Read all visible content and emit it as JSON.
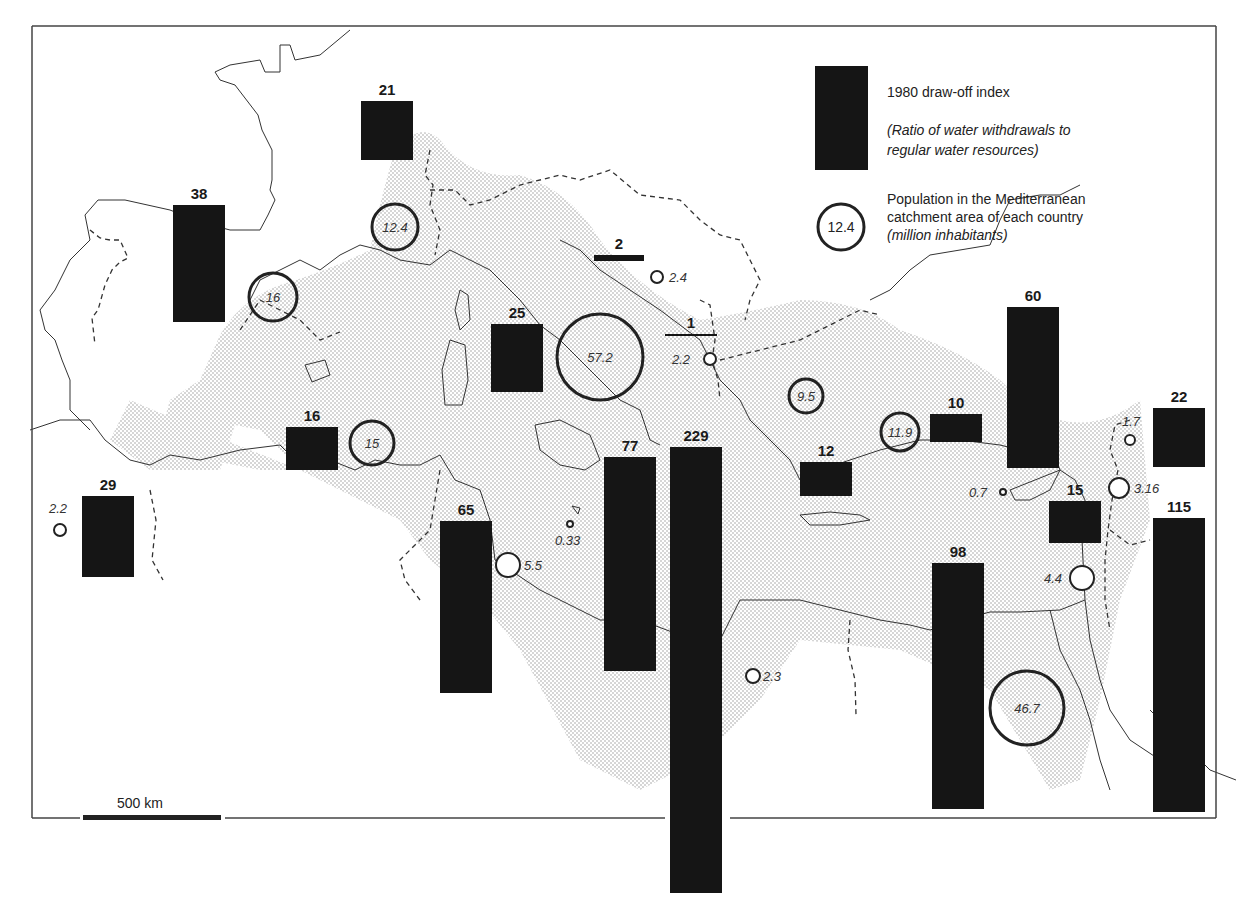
{
  "legend": {
    "bar_title": "1980 draw-off index",
    "bar_desc_1": "(Ratio of water withdrawals to",
    "bar_desc_2": "regular water resources)",
    "circle_sample": "12.4",
    "circle_title_1": "Population in the Mediterranean",
    "circle_title_2": "catchment area of each country",
    "circle_desc": "(million inhabitants)"
  },
  "scale": {
    "label": "500 km"
  },
  "colors": {
    "bar": "#151515",
    "shade": "#d4d4d4",
    "line": "#333333",
    "frame": "#444444"
  },
  "chart_data": {
    "type": "bar",
    "legend_position": "top-right",
    "series": [
      {
        "name": "1980 draw-off index (ratio of water withdrawals to regular water resources)",
        "bars": [
          {
            "value": 38,
            "x": 173,
            "y": 205,
            "w": 52,
            "h": 117
          },
          {
            "value": 21,
            "x": 361,
            "y": 101,
            "w": 52,
            "h": 59
          },
          {
            "value": 2,
            "x": 594,
            "y": 255,
            "w": 50,
            "h": 6
          },
          {
            "value": 25,
            "x": 491,
            "y": 324,
            "w": 52,
            "h": 68
          },
          {
            "value": 1,
            "x": 665,
            "y": 334,
            "w": 52,
            "h": 2
          },
          {
            "value": 16,
            "x": 286,
            "y": 427,
            "w": 52,
            "h": 43
          },
          {
            "value": 29,
            "x": 82,
            "y": 496,
            "w": 52,
            "h": 81
          },
          {
            "value": 65,
            "x": 440,
            "y": 521,
            "w": 52,
            "h": 172
          },
          {
            "value": 77,
            "x": 604,
            "y": 457,
            "w": 52,
            "h": 214
          },
          {
            "value": 229,
            "x": 670,
            "y": 447,
            "w": 52,
            "h": 446
          },
          {
            "value": 12,
            "x": 800,
            "y": 462,
            "w": 52,
            "h": 34
          },
          {
            "value": 10,
            "x": 930,
            "y": 414,
            "w": 52,
            "h": 28
          },
          {
            "value": 60,
            "x": 1007,
            "y": 307,
            "w": 52,
            "h": 161
          },
          {
            "value": 22,
            "x": 1153,
            "y": 408,
            "w": 52,
            "h": 59
          },
          {
            "value": 15,
            "x": 1049,
            "y": 501,
            "w": 52,
            "h": 42
          },
          {
            "value": 98,
            "x": 932,
            "y": 563,
            "w": 52,
            "h": 246
          },
          {
            "value": 115,
            "x": 1153,
            "y": 518,
            "w": 52,
            "h": 294
          }
        ]
      },
      {
        "name": "Population in the Mediterranean catchment area (million inhabitants)",
        "circles": [
          {
            "value": "16",
            "cx": 273,
            "cy": 297,
            "r": 24,
            "label_inside": true
          },
          {
            "value": "12.4",
            "cx": 395,
            "cy": 227,
            "r": 23,
            "label_inside": true
          },
          {
            "value": "2.4",
            "cx": 657,
            "cy": 277,
            "r": 6,
            "label_dx": 12,
            "label_dy": 5
          },
          {
            "value": "57.2",
            "cx": 600,
            "cy": 357,
            "r": 43,
            "label_inside": true
          },
          {
            "value": "2.2",
            "cx": 710,
            "cy": 359,
            "r": 6,
            "label_dx": -38,
            "label_dy": 5
          },
          {
            "value": "15",
            "cx": 372,
            "cy": 443,
            "r": 22,
            "label_inside": true
          },
          {
            "value": "2.2",
            "cx": 60,
            "cy": 530,
            "r": 6,
            "label_dx": -11,
            "label_dy": -17
          },
          {
            "value": "0.33",
            "cx": 570,
            "cy": 524,
            "r": 3,
            "label_dx": -15,
            "label_dy": 21
          },
          {
            "value": "5.5",
            "cx": 508,
            "cy": 565,
            "r": 12,
            "label_dx": 16,
            "label_dy": 5
          },
          {
            "value": "9.5",
            "cx": 806,
            "cy": 396,
            "r": 17,
            "label_inside": true
          },
          {
            "value": "11.9",
            "cx": 900,
            "cy": 432,
            "r": 19,
            "label_inside": true
          },
          {
            "value": "0.7",
            "cx": 1003,
            "cy": 492,
            "r": 3,
            "label_dx": -34,
            "label_dy": 5
          },
          {
            "value": "1.7",
            "cx": 1130,
            "cy": 440,
            "r": 5,
            "label_dx": -8,
            "label_dy": -14
          },
          {
            "value": "3.16",
            "cx": 1119,
            "cy": 488,
            "r": 10,
            "label_dx": 15,
            "label_dy": 5
          },
          {
            "value": "4.4",
            "cx": 1082,
            "cy": 578,
            "r": 12,
            "label_dx": -38,
            "label_dy": 5
          },
          {
            "value": "2.3",
            "cx": 753,
            "cy": 676,
            "r": 7,
            "label_dx": 10,
            "label_dy": 5
          },
          {
            "value": "46.7",
            "cx": 1027,
            "cy": 708,
            "r": 37,
            "label_inside": true
          }
        ]
      }
    ],
    "xlabel": "",
    "ylabel": ""
  }
}
